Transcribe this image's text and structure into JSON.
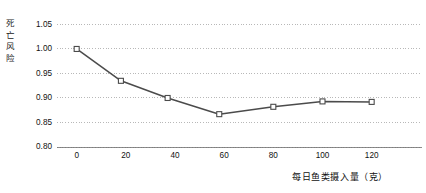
{
  "chart_data": {
    "type": "line",
    "title": "",
    "subtitle": "",
    "xlabel": "每日鱼类摄入量（克）",
    "ylabel": "死亡风险",
    "xlim": [
      -8,
      136
    ],
    "ylim": [
      0.8,
      1.055
    ],
    "xticks": [
      0,
      20,
      40,
      60,
      80,
      100,
      120
    ],
    "xtick_labels": [
      "0",
      "20",
      "40",
      "60",
      "80",
      "100",
      "120"
    ],
    "yticks": [
      0.8,
      0.85,
      0.9,
      0.95,
      1.0,
      1.05
    ],
    "ytick_labels": [
      "0.80",
      "0.85",
      "0.90",
      "0.95",
      "1.00",
      "1.05"
    ],
    "grid": "horizontal-dotted",
    "legend": "none",
    "annotations": [],
    "series": [
      {
        "name": "死亡风险",
        "marker": "open-square",
        "color": "#4b4b4b",
        "x": [
          0,
          18,
          37,
          58,
          80,
          100,
          120
        ],
        "values": [
          1.0,
          0.935,
          0.9,
          0.867,
          0.882,
          0.893,
          0.892
        ]
      }
    ]
  },
  "figure": {
    "name": "死亡风险折线图",
    "background": "#ffffff",
    "line_color": "#4b4b4b",
    "grid_color": "#9a9a9a",
    "axis_color": "#6f6f6f"
  }
}
